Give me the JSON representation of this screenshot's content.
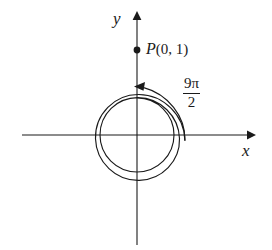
{
  "figure": {
    "kind": "polar-angle-diagram",
    "background_color": "#ffffff",
    "stroke_color": "#1a1a1a",
    "axes": {
      "x_label": "x",
      "y_label": "y",
      "origin": [
        137,
        135
      ],
      "x_axis_from": [
        22,
        135
      ],
      "x_axis_to": [
        252,
        135
      ],
      "y_axis_from": [
        137,
        245
      ],
      "y_axis_to": [
        137,
        14
      ],
      "x_arrow": "right",
      "y_arrow": "up"
    },
    "point": {
      "name": "P",
      "coords_text": "(0, 1)",
      "full_label": "P(0, 1)",
      "x": 0,
      "y": 1,
      "pixel": [
        137,
        50
      ],
      "marker": "filled-dot"
    },
    "angle": {
      "numerator": "9π",
      "denominator": "2",
      "label": "9π/2",
      "radians_value": 14.137,
      "turns": 2.25,
      "direction": "counterclockwise",
      "arrow_head": "left",
      "arrow_tip_pixel": [
        137,
        80
      ]
    },
    "spiral": {
      "inner_radius": 37,
      "outer_radius": 48,
      "loops": 2.25,
      "center": [
        137,
        135
      ]
    }
  }
}
